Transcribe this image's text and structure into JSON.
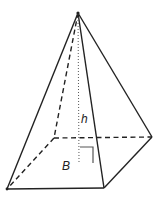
{
  "figure": {
    "type": "square pyramid",
    "labels": {
      "height": "h",
      "base": "B"
    },
    "colors": {
      "stroke": "#222222",
      "background": "#ffffff"
    },
    "points": {
      "apex": [
        78,
        13
      ],
      "base_back_left": [
        54,
        138
      ],
      "base_back_right": [
        152,
        137
      ],
      "base_front_left": [
        7,
        189
      ],
      "base_front_right": [
        104,
        188
      ],
      "height_foot": [
        79,
        163
      ]
    }
  }
}
